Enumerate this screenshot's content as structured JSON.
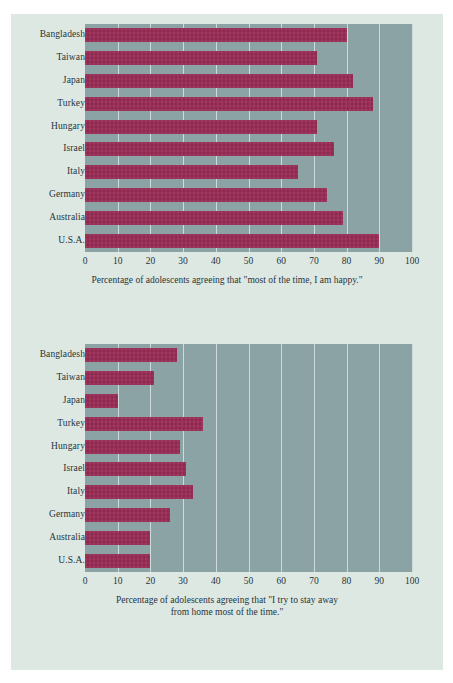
{
  "page": {
    "background_color": "#ffffff",
    "panel_color": "#dde8e3"
  },
  "style": {
    "bar_color": "#992a54",
    "plot_background_color": "#8ba3a4",
    "gridline_color": "#cddcd8",
    "text_color": "#26343a"
  },
  "charts": [
    {
      "name": "happiness-chart",
      "caption_lines": [
        "Percentage of adolescents agreeing that \"most of the time, I am happy.\""
      ],
      "chart_data": {
        "type": "bar",
        "orientation": "horizontal",
        "title": "",
        "subtitle": "",
        "xlabel": "Percentage of adolescents agreeing that \"most of the time, I am happy.\"",
        "ylabel": "",
        "xlim": [
          0,
          100
        ],
        "ylim": null,
        "grid": true,
        "legend": false,
        "xticks": [
          "0",
          "10",
          "20",
          "30",
          "40",
          "50",
          "60",
          "70",
          "80",
          "90",
          "100"
        ],
        "categories": [
          "Bangladesh",
          "Taiwan",
          "Japan",
          "Turkey",
          "Hungary",
          "Israel",
          "Italy",
          "Germany",
          "Australia",
          "U.S.A."
        ],
        "values": [
          80,
          71,
          82,
          88,
          71,
          76,
          65,
          74,
          79,
          90
        ]
      }
    },
    {
      "name": "stay-away-from-home-chart",
      "caption_lines": [
        "Percentage of adolescents agreeing that \"I try to stay away",
        "from home most of the time.\""
      ],
      "chart_data": {
        "type": "bar",
        "orientation": "horizontal",
        "title": "",
        "subtitle": "",
        "xlabel": "Percentage of adolescents agreeing that \"I try to stay away from home most of the time.\"",
        "ylabel": "",
        "xlim": [
          0,
          100
        ],
        "ylim": null,
        "grid": true,
        "legend": false,
        "xticks": [
          "0",
          "10",
          "20",
          "30",
          "40",
          "50",
          "60",
          "70",
          "80",
          "90",
          "100"
        ],
        "categories": [
          "Bangladesh",
          "Taiwan",
          "Japan",
          "Turkey",
          "Hungary",
          "Israel",
          "Italy",
          "Germany",
          "Australia",
          "U.S.A."
        ],
        "values": [
          28,
          21,
          10,
          36,
          29,
          31,
          33,
          26,
          20,
          20
        ]
      }
    }
  ]
}
